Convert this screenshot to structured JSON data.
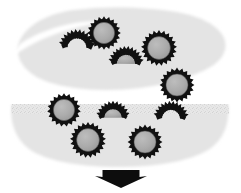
{
  "figure": {
    "width": 241,
    "height": 193,
    "background_color": "#ffffff"
  },
  "colors": {
    "background": "#ffffff",
    "lobe_fill": "#e7e7e7",
    "lobe_fill_light": "#efefef",
    "particle_core": "#a9a9a9",
    "particle_core_stroke": "#4a4a4a",
    "particle_rim": "#111111",
    "arrow": "#0d0d0d",
    "speckle": "#d2d2d2"
  },
  "regions": [
    {
      "id": "upper-lobe",
      "label": "upper lobe",
      "shape": "tilted-crescent-blob",
      "fill": "#e7e7e7",
      "path": "M 18 46 C 22 28, 44 14, 74 10 C 106 6, 146 7, 176 12 C 200 16, 218 25, 224 38 C 228 48, 224 58, 212 66 C 196 76, 170 84, 140 88 C 106 92, 72 90, 48 82 C 28 75, 16 62, 18 46 Z",
      "rotation_hint": "major axis tilted about -8 degrees"
    },
    {
      "id": "lower-lobe",
      "label": "lower lobe",
      "shape": "flat-top-rounded-bottom-blob",
      "fill": "#e7e7e7",
      "path": "M 12 104 L 228 104 C 230 122, 224 140, 208 150 C 188 162, 152 167, 118 167 C 84 167, 50 162, 32 151 C 16 141, 9 122, 12 104 Z",
      "flat_edge": "top"
    }
  ],
  "particles": [
    {
      "id": "p1",
      "region": "upper-lobe",
      "type": "closed-capsid",
      "cx": 104,
      "cy": 33,
      "r": 14,
      "teeth": 20,
      "core_fill": "#a9a9a9",
      "rim_color": "#111111"
    },
    {
      "id": "p2",
      "region": "upper-lobe",
      "type": "open-arc",
      "cx": 77,
      "cy": 48,
      "r": 12.5,
      "teeth": 13,
      "arc_start_deg": 185,
      "arc_sweep_deg": 175,
      "core_fill": "none",
      "rim_color": "#111111"
    },
    {
      "id": "p3",
      "region": "upper-lobe",
      "type": "closed-capsid",
      "cx": 159,
      "cy": 48,
      "r": 15,
      "teeth": 21,
      "core_fill": "#a9a9a9",
      "rim_color": "#111111"
    },
    {
      "id": "p4",
      "region": "upper-lobe",
      "type": "open-arc",
      "cx": 126,
      "cy": 64,
      "r": 12,
      "teeth": 13,
      "arc_start_deg": 182,
      "arc_sweep_deg": 178,
      "core_fill": "#a9a9a9",
      "rim_color": "#111111"
    },
    {
      "id": "p5",
      "region": "upper-lobe",
      "type": "closed-capsid",
      "cx": 177,
      "cy": 85,
      "r": 14.5,
      "teeth": 20,
      "core_fill": "#a9a9a9",
      "rim_color": "#111111"
    },
    {
      "id": "p6",
      "region": "lower-lobe",
      "type": "closed-capsid",
      "cx": 64,
      "cy": 110,
      "r": 14,
      "teeth": 19,
      "core_fill": "#a9a9a9",
      "rim_color": "#111111"
    },
    {
      "id": "p7",
      "region": "lower-lobe",
      "type": "open-arc",
      "cx": 113,
      "cy": 118,
      "r": 11.5,
      "teeth": 12,
      "arc_start_deg": 182,
      "arc_sweep_deg": 176,
      "core_fill": "#a9a9a9",
      "rim_color": "#111111"
    },
    {
      "id": "p8",
      "region": "lower-lobe",
      "type": "open-arc",
      "cx": 171,
      "cy": 119,
      "r": 12,
      "teeth": 13,
      "arc_start_deg": 184,
      "arc_sweep_deg": 174,
      "core_fill": "none",
      "rim_color": "#111111"
    },
    {
      "id": "p9",
      "region": "lower-lobe",
      "type": "closed-capsid",
      "cx": 88,
      "cy": 140,
      "r": 15,
      "teeth": 21,
      "core_fill": "#a9a9a9",
      "rim_color": "#111111"
    },
    {
      "id": "p10",
      "region": "lower-lobe",
      "type": "closed-capsid",
      "cx": 145,
      "cy": 142,
      "r": 14.5,
      "teeth": 20,
      "core_fill": "#a9a9a9",
      "rim_color": "#111111"
    }
  ],
  "arrow": {
    "id": "transport-arrow",
    "direction": "down",
    "color": "#0d0d0d",
    "tail_x": 103,
    "tail_y": 170,
    "tail_width": 37,
    "tail_height": 7,
    "head_half_width": 26,
    "head_tip_y": 188,
    "center_x": 121
  },
  "legend_counts": {
    "closed_capsids": 6,
    "open_arcs": 4,
    "total_particles": 10
  }
}
